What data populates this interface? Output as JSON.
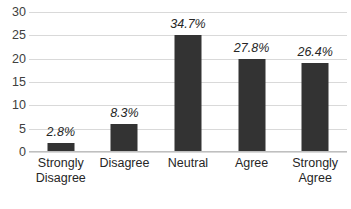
{
  "chart_data": {
    "type": "bar",
    "title": "",
    "subtitle": "",
    "xlabel": "",
    "ylabel": "",
    "categories": [
      "Strongly Disagree",
      "Disagree",
      "Neutral",
      "Agree",
      "Strongly Agree"
    ],
    "category_lines": [
      [
        "Strongly",
        "Disagree"
      ],
      [
        "Disagree"
      ],
      [
        "Neutral"
      ],
      [
        "Agree"
      ],
      [
        "Strongly",
        "Agree"
      ]
    ],
    "values": [
      2,
      6,
      25,
      20,
      19
    ],
    "data_labels": [
      "2.8%",
      "8.3%",
      "34.7%",
      "27.8%",
      "26.4%"
    ],
    "percentages": [
      2.8,
      8.3,
      34.7,
      27.8,
      26.4
    ],
    "ylim": [
      0,
      30
    ],
    "ytick_values": [
      0,
      5,
      10,
      15,
      20,
      25,
      30
    ],
    "ytick_labels": [
      "0",
      "5",
      "10",
      "15",
      "20",
      "25",
      "30"
    ],
    "grid": true,
    "legend": false,
    "legend_position": "none",
    "colors": {
      "bar": "#333333",
      "gridline": "#d9d9d9",
      "axis": "#bfbfbf",
      "text": "#262626",
      "tick_text": "#404040",
      "background": "#ffffff"
    }
  }
}
